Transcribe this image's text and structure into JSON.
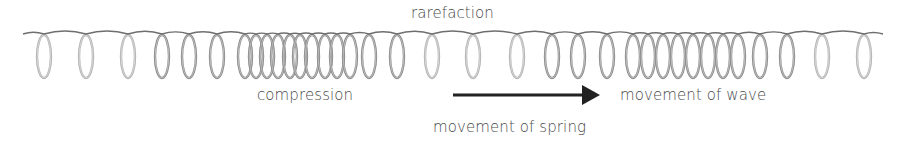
{
  "diagram": {
    "type": "longitudinal-wave-spring",
    "labels": {
      "rarefaction": "rarefaction",
      "compression": "compression",
      "movement_of_wave": "movement of wave",
      "movement_of_spring": "movement of spring"
    },
    "spring": {
      "wire_start_x": 23,
      "wire_end_x": 883,
      "wire_y": 34,
      "coil_top_y": 35,
      "coil_bottom_y": 78,
      "coil_half_width": 7,
      "coil_centers_x": [
        44,
        86,
        128,
        162,
        189,
        217,
        245,
        256,
        267,
        278,
        290,
        300,
        312,
        325,
        337,
        350,
        369,
        397,
        432,
        473,
        517,
        552,
        578,
        607,
        633,
        648,
        663,
        678,
        693,
        708,
        723,
        738,
        760,
        787,
        822,
        864
      ],
      "wire_color": "#6e6e6e",
      "coil_color": "#8c8c8c",
      "coil_light_color": "#b4b4b4"
    },
    "arrow": {
      "x1": 453,
      "x2": 600,
      "y": 95,
      "head_length": 18,
      "head_half_height": 10,
      "color": "#222222",
      "direction": "right"
    },
    "colors": {
      "text": "#4a4a4a",
      "background": "#ffffff"
    }
  }
}
